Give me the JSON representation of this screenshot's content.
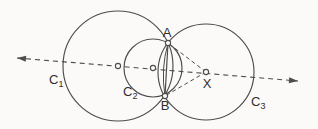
{
  "figure": {
    "width": 318,
    "height": 129,
    "background_color": "#fbfaf8",
    "line_color": "#4d4d4d",
    "label_color": "#2f2f2f",
    "label_font_size": 13,
    "subscript_font_size": 9,
    "circles": [
      {
        "id": "C1",
        "cx": 118,
        "cy": 66,
        "r": 55,
        "label_base": "C",
        "label_sub": "1",
        "label_x": 49,
        "label_y": 84
      },
      {
        "id": "C2",
        "cx": 153,
        "cy": 68,
        "r": 29,
        "label_base": "C",
        "label_sub": "2",
        "label_x": 123,
        "label_y": 96
      },
      {
        "id": "C3",
        "cx": 206,
        "cy": 72,
        "r": 48,
        "label_base": "C",
        "label_sub": "3",
        "label_x": 251,
        "label_y": 106
      }
    ],
    "center_line": {
      "x1": 17,
      "y1": 58,
      "x2": 298,
      "y2": 81,
      "dash": "5 4",
      "arrows": "both"
    },
    "points": [
      {
        "id": "A",
        "x": 168,
        "y": 43,
        "label": "A",
        "label_x": 167,
        "label_y": 37
      },
      {
        "id": "B",
        "x": 165,
        "y": 96,
        "label": "B",
        "label_x": 165,
        "label_y": 110
      },
      {
        "id": "X",
        "x": 206,
        "y": 72,
        "label": "X",
        "label_x": 207,
        "label_y": 88
      },
      {
        "id": "O1",
        "x": 118,
        "y": 66,
        "label": "",
        "label_x": 0,
        "label_y": 0
      },
      {
        "id": "O2",
        "x": 153,
        "y": 68,
        "label": "",
        "label_x": 0,
        "label_y": 0
      }
    ],
    "chord": {
      "from": "A",
      "to": "B",
      "bow_offset": -3
    },
    "dashed_segments": [
      {
        "id": "XA",
        "from": "X",
        "to": "A"
      },
      {
        "id": "XB",
        "from": "X",
        "to": "B"
      }
    ],
    "point_marker_radius": 2.6,
    "radius_dash": "4 3",
    "arrow_length": 9,
    "arrow_half_width": 3
  }
}
